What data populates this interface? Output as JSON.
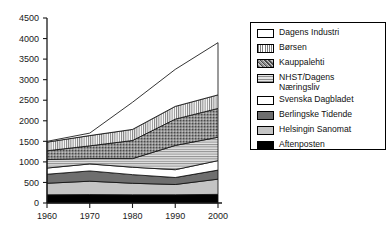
{
  "chart_data": {
    "type": "area",
    "stacked": true,
    "title": "",
    "xlabel": "",
    "ylabel": "",
    "x": [
      1960,
      1970,
      1980,
      1990,
      2000
    ],
    "xtick_labels": [
      "1960",
      "1970",
      "1980",
      "1990",
      "2000"
    ],
    "ytick_labels": [
      "0",
      "500",
      "1000",
      "1500",
      "2000",
      "2500",
      "3000",
      "3500",
      "4000",
      "4500"
    ],
    "yticks": [
      0,
      500,
      1000,
      1500,
      2000,
      2500,
      3000,
      3500,
      4000,
      4500
    ],
    "ylim": [
      0,
      4500
    ],
    "xlim": [
      1960,
      2000
    ],
    "grid": false,
    "legend_position": "right-inside",
    "stack_order_bottom_to_top": [
      "Aftenposten",
      "Helsingin Sanomat",
      "Berlingske Tidende",
      "Svenska Dagbladet",
      "NHST/Dagens Næringsliv",
      "Kauppalehti",
      "Børsen",
      "Dagens Industri"
    ],
    "series": [
      {
        "name": "Aftenposten",
        "values": [
          200,
          205,
          200,
          200,
          210
        ],
        "fill": "#000000",
        "pattern": "solid-black"
      },
      {
        "name": "Helsingin Sanomat",
        "values": [
          280,
          325,
          280,
          250,
          370
        ],
        "fill": "#c4c4c4",
        "pattern": "solid-light-gray"
      },
      {
        "name": "Berlingske Tidende",
        "values": [
          220,
          250,
          210,
          170,
          220
        ],
        "fill": "#6e6e6e",
        "pattern": "solid-dark-gray"
      },
      {
        "name": "Svenska Dagbladet",
        "values": [
          150,
          170,
          180,
          190,
          230
        ],
        "fill": "#ffffff",
        "pattern": "solid-white"
      },
      {
        "name": "NHST/Dagens Næringsliv",
        "values": [
          210,
          130,
          210,
          590,
          570
        ],
        "fill": "#d0d0d0",
        "pattern": "horizontal-lines"
      },
      {
        "name": "Kauppalehti",
        "values": [
          210,
          310,
          440,
          640,
          700
        ],
        "fill": "#8a8a8a",
        "pattern": "speckle"
      },
      {
        "name": "Børsen",
        "values": [
          210,
          250,
          270,
          310,
          330
        ],
        "fill": "#e8e8e8",
        "pattern": "vertical-lines"
      },
      {
        "name": "Dagens Industri",
        "values": [
          20,
          60,
          660,
          900,
          1270
        ],
        "fill": "#ffffff",
        "pattern": "solid-white"
      }
    ],
    "cumulative_totals": [
      1500,
      1700,
      2450,
      3250,
      3900
    ]
  },
  "legend": {
    "items": [
      {
        "label": "Dagens Industri",
        "pattern": "solid-white"
      },
      {
        "label": "Børsen",
        "pattern": "vertical-lines"
      },
      {
        "label": "Kauppalehti",
        "pattern": "speckle"
      },
      {
        "label": "NHST/Dagens\nNæringsliv",
        "pattern": "horizontal-lines"
      },
      {
        "label": "Svenska Dagbladet",
        "pattern": "solid-white"
      },
      {
        "label": "Berlingske Tidende",
        "pattern": "solid-dark-gray"
      },
      {
        "label": "Helsingin Sanomat",
        "pattern": "solid-light-gray"
      },
      {
        "label": "Aftenposten",
        "pattern": "solid-black"
      }
    ]
  },
  "colors": {
    "axis": "#1a1a1a",
    "outline": "#000000",
    "black": "#000000",
    "light_gray": "#c4c4c4",
    "dark_gray": "#6e6e6e",
    "mid_gray": "#8a8a8a",
    "pale_gray": "#d0d0d0",
    "white": "#ffffff",
    "background": "#ffffff"
  }
}
